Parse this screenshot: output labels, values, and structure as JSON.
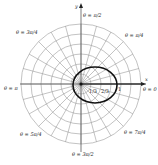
{
  "diagram": {
    "type": "polar-graph",
    "center": [
      81,
      84
    ],
    "grid": {
      "circle_count": 6,
      "outer_radius": 60,
      "radial_step_deg": 15,
      "grid_color": "#9a9a9a",
      "curve_color": "#111111"
    },
    "axes": {
      "x_label": "x",
      "y_label": "y"
    },
    "angle_labels": [
      {
        "id": "theta-0",
        "text": "θ = 0"
      },
      {
        "id": "theta-pi-4",
        "text": "θ = π/4"
      },
      {
        "id": "theta-pi-2",
        "text": "θ = π/2"
      },
      {
        "id": "theta-3pi-4",
        "text": "θ = 3π/4"
      },
      {
        "id": "theta-pi",
        "text": "θ = π"
      },
      {
        "id": "theta-5pi-4",
        "text": "θ = 5π/4"
      },
      {
        "id": "theta-3pi-2",
        "text": "θ = 3π/2"
      },
      {
        "id": "theta-7pi-4",
        "text": "θ = 7π/4"
      }
    ],
    "radial_tick_labels": [
      "1/3",
      "2/3",
      "1"
    ],
    "curve": {
      "description": "closed oval curve through the pole region, extending to r = 1 along θ = 0",
      "left_x": 73,
      "right_x": 117,
      "top_y": 67,
      "bottom_y": 103
    }
  }
}
